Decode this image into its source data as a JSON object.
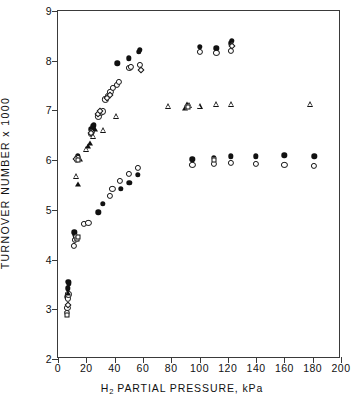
{
  "chart_data": {
    "type": "scatter",
    "title": "",
    "xlabel": "H2 PARTIAL PRESSURE, kPa",
    "xlabel_parts": {
      "pre": "H",
      "sub": "2",
      "post": " PARTIAL PRESSURE, kPa"
    },
    "ylabel": "TURNOVER NUMBER x 1000",
    "xlim": [
      0,
      200
    ],
    "ylim": [
      2,
      9
    ],
    "xticks": [
      0,
      20,
      40,
      60,
      80,
      100,
      120,
      140,
      160,
      180,
      200
    ],
    "yticks": [
      2,
      3,
      4,
      5,
      6,
      7,
      8,
      9
    ],
    "xtick_labels": [
      "0",
      "20",
      "40",
      "60",
      "80",
      "100",
      "120",
      "140",
      "160",
      "180",
      "200"
    ],
    "ytick_labels": [
      "2",
      "3",
      "4",
      "5",
      "6",
      "7",
      "8",
      "9"
    ],
    "grid": false,
    "legend": "none",
    "series": [
      {
        "name": "filled-circle",
        "marker": "filled-circle",
        "points": [
          [
            6.5,
            3.25
          ],
          [
            7.0,
            3.42
          ],
          [
            7.3,
            3.55
          ],
          [
            7.6,
            3.52
          ],
          [
            11.5,
            4.55
          ],
          [
            12.0,
            4.5
          ],
          [
            12.4,
            4.44
          ],
          [
            28.5,
            4.95
          ],
          [
            31.5,
            5.12
          ],
          [
            13.5,
            6.05
          ],
          [
            14.0,
            6.08
          ],
          [
            23.5,
            6.62
          ],
          [
            24.5,
            6.68
          ],
          [
            25.5,
            6.7
          ],
          [
            42.0,
            7.95
          ],
          [
            50.0,
            8.05
          ],
          [
            57.0,
            8.18
          ],
          [
            58.0,
            8.22
          ],
          [
            44.5,
            5.42
          ],
          [
            50.5,
            5.55
          ],
          [
            56.5,
            5.7
          ],
          [
            95.0,
            6.02
          ],
          [
            110.0,
            6.05
          ],
          [
            122.0,
            6.08
          ],
          [
            140.0,
            6.08
          ],
          [
            160.0,
            6.1
          ],
          [
            181.0,
            6.08
          ],
          [
            100.0,
            8.28
          ],
          [
            112.0,
            8.25
          ],
          [
            122.0,
            8.35
          ],
          [
            123.0,
            8.4
          ]
        ]
      },
      {
        "name": "open-circle",
        "marker": "open-circle",
        "points": [
          [
            6.2,
            2.92
          ],
          [
            6.6,
            3.02
          ],
          [
            7.0,
            3.22
          ],
          [
            7.4,
            3.3
          ],
          [
            11.0,
            4.28
          ],
          [
            12.2,
            4.4
          ],
          [
            12.8,
            4.45
          ],
          [
            13.2,
            4.42
          ],
          [
            18.5,
            4.72
          ],
          [
            21.5,
            4.74
          ],
          [
            13.2,
            6.0
          ],
          [
            14.2,
            6.05
          ],
          [
            23.0,
            6.52
          ],
          [
            24.0,
            6.56
          ],
          [
            28.5,
            6.88
          ],
          [
            30.5,
            6.95
          ],
          [
            32.0,
            6.98
          ],
          [
            33.5,
            7.22
          ],
          [
            35.5,
            7.3
          ],
          [
            37.0,
            7.38
          ],
          [
            39.0,
            7.45
          ],
          [
            41.5,
            7.52
          ],
          [
            43.0,
            7.58
          ],
          [
            50.5,
            7.85
          ],
          [
            51.5,
            7.88
          ],
          [
            58.0,
            7.92
          ],
          [
            36.5,
            5.28
          ],
          [
            38.5,
            5.42
          ],
          [
            44.0,
            5.58
          ],
          [
            50.0,
            5.72
          ],
          [
            56.5,
            5.85
          ],
          [
            95.0,
            5.9
          ],
          [
            110.0,
            5.92
          ],
          [
            122.0,
            5.94
          ],
          [
            140.0,
            5.92
          ],
          [
            160.0,
            5.9
          ],
          [
            181.0,
            5.88
          ],
          [
            100.0,
            8.18
          ],
          [
            112.0,
            8.15
          ],
          [
            122.0,
            8.2
          ]
        ]
      },
      {
        "name": "filled-triangle",
        "marker": "filled-triangle",
        "points": [
          [
            7.0,
            3.32
          ],
          [
            14.0,
            5.52
          ],
          [
            15.5,
            6.02
          ],
          [
            21.5,
            6.28
          ],
          [
            22.5,
            6.35
          ],
          [
            26.0,
            6.62
          ],
          [
            90.0,
            7.05
          ],
          [
            91.0,
            7.12
          ]
        ]
      },
      {
        "name": "open-triangle",
        "marker": "open-triangle",
        "points": [
          [
            13.0,
            5.68
          ],
          [
            20.0,
            6.22
          ],
          [
            24.5,
            6.48
          ],
          [
            32.0,
            6.6
          ],
          [
            41.0,
            6.88
          ],
          [
            78.0,
            7.08
          ],
          [
            92.5,
            7.1
          ],
          [
            100.0,
            7.08
          ],
          [
            112.0,
            7.12
          ],
          [
            122.0,
            7.12
          ],
          [
            178.0,
            7.12
          ]
        ]
      },
      {
        "name": "open-diamond",
        "marker": "open-diamond",
        "points": [
          [
            6.8,
            3.08
          ],
          [
            13.0,
            6.02
          ],
          [
            23.5,
            6.55
          ],
          [
            28.0,
            6.92
          ],
          [
            30.0,
            6.98
          ],
          [
            34.5,
            7.25
          ],
          [
            36.5,
            7.32
          ],
          [
            58.5,
            7.82
          ],
          [
            123.0,
            8.3
          ]
        ]
      },
      {
        "name": "open-square",
        "marker": "open-square",
        "points": [
          [
            6.4,
            2.88
          ],
          [
            13.6,
            4.42
          ],
          [
            14.0,
            4.46
          ],
          [
            13.8,
            6.0
          ],
          [
            92.0,
            7.06
          ],
          [
            110.0,
            6.0
          ]
        ]
      }
    ]
  }
}
